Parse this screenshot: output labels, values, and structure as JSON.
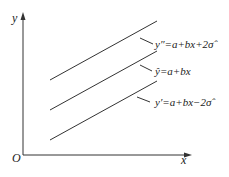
{
  "axes": {
    "y_label": "y",
    "x_label": "x",
    "origin_label": "O"
  },
  "lines": [
    {
      "name": "upper-bound",
      "label": "y″=a+bx+2σ̂",
      "x1": 50,
      "y1": 80,
      "x2": 157,
      "y2": 21
    },
    {
      "name": "regression",
      "label": "ŷ=a+bx",
      "x1": 50,
      "y1": 110,
      "x2": 157,
      "y2": 51
    },
    {
      "name": "lower-bound",
      "label": "y′=a+bx−2σ̂",
      "x1": 50,
      "y1": 140,
      "x2": 157,
      "y2": 81
    }
  ],
  "colors": {
    "line": "#333333",
    "text": "#222222",
    "background": "#ffffff"
  }
}
